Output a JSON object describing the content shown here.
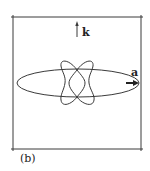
{
  "figure": {
    "panel_label": "(b)",
    "vector_k_label": "k",
    "vector_a_label": "a",
    "colors": {
      "line": "#3a3a3a",
      "background": "#ffffff"
    },
    "box": {
      "left": 13,
      "top": 17,
      "right": 141,
      "bottom": 149
    },
    "ellipse": {
      "cx": 78,
      "cy": 83,
      "rx": 61,
      "ry": 14
    },
    "rosette": {
      "cx": 78,
      "cy": 83,
      "lobes": 4
    }
  }
}
